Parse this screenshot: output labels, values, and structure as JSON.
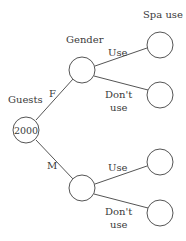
{
  "diagram": {
    "type": "tree",
    "column_headers": {
      "guests": "Guests",
      "gender": "Gender",
      "spa": "Spa use"
    },
    "root": {
      "value": "2000"
    },
    "branches": {
      "female": {
        "label": "F",
        "children": {
          "use": "Use",
          "dont_use_line1": "Don't",
          "dont_use_line2": "use"
        }
      },
      "male": {
        "label": "M",
        "children": {
          "use": "Use",
          "dont_use_line1": "Don't",
          "dont_use_line2": "use"
        }
      }
    }
  }
}
